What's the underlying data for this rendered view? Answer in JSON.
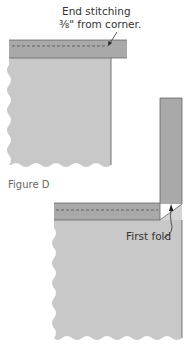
{
  "figure": {
    "caption": "Figure D",
    "top_callout": {
      "line1": "End stitching",
      "line2": "⅜\" from corner."
    },
    "bottom_callout": "First fold"
  },
  "colors": {
    "fabric_light": "#c8c8c8",
    "binding_strip": "#a9a9a9",
    "fold_face": "#d4d4d4",
    "outline": "#555555",
    "text": "#333333",
    "caption_text": "#666666"
  },
  "diagrams": [
    {
      "name": "stitching-to-corner",
      "description": "Binding strip stitched along top edge of quilt, ending ⅜ inch from corner"
    },
    {
      "name": "first-fold",
      "description": "Binding strip folded up at 45-degree angle to form first fold at corner"
    }
  ]
}
